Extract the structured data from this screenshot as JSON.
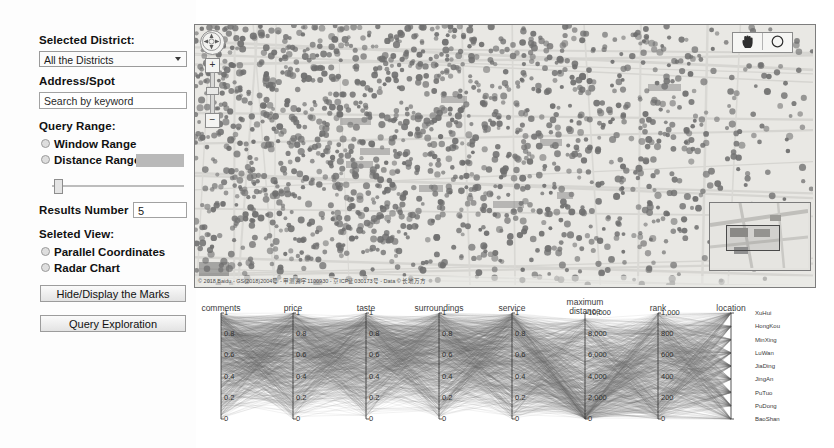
{
  "panel": {
    "district_label": "Selected District:",
    "district_value": "All the Districts",
    "district_options": [
      "All the Districts"
    ],
    "address_label": "Address/Spot",
    "search_placeholder": "Search by keyword",
    "search_value": "Search by keyword",
    "query_range_label": "Query Range:",
    "window_range_label": "Window Range",
    "distance_range_label": "Distance Range",
    "distance_swatch_color": "#b9b9b9",
    "results_number_label": "Results Number",
    "results_number_value": "5",
    "selected_view_label": "Seleted View:",
    "parallel_coordinates_label": "Parallel Coordinates",
    "radar_chart_label": "Radar Chart",
    "hide_display_button": "Hide/Display the Marks",
    "query_exploration_button": "Query Exploration"
  },
  "map": {
    "attribution": "© 2018 Baidu - GS(2018)2004号 - 甲测资字1100930 - 京ICP证030173号 - Data © 长地万方",
    "zoom_in_label": "+",
    "zoom_out_label": "−",
    "tool_pan_name": "hand-tool",
    "tool_circle_name": "circle-select-tool",
    "point_color": "#6f6f6f",
    "background_color": "#e9e8e4"
  },
  "chart_data": {
    "type": "line",
    "subtype": "parallel-coordinates",
    "title": "",
    "axes": [
      {
        "name": "comments",
        "label": "comments",
        "ticks": [
          "1",
          "0.8",
          "0.6",
          "0.4",
          "0.2",
          "0"
        ],
        "range": [
          0,
          1
        ]
      },
      {
        "name": "price",
        "label": "price",
        "ticks": [
          "1",
          "0.8",
          "0.6",
          "0.4",
          "0.2",
          "0"
        ],
        "range": [
          0,
          1
        ]
      },
      {
        "name": "taste",
        "label": "taste",
        "ticks": [
          "1",
          "0.8",
          "0.6",
          "0.4",
          "0.2",
          "0"
        ],
        "range": [
          0,
          1
        ]
      },
      {
        "name": "surroundings",
        "label": "surroundings",
        "ticks": [
          "1",
          "0.8",
          "0.6",
          "0.4",
          "0.2",
          "0"
        ],
        "range": [
          0,
          1
        ]
      },
      {
        "name": "service",
        "label": "service",
        "ticks": [
          "1",
          "0.8",
          "0.6",
          "0.4",
          "0.2",
          "0"
        ],
        "range": [
          0,
          1
        ]
      },
      {
        "name": "maximum_distance",
        "label": "maximum\ndistance",
        "ticks": [
          "10,000",
          "8,000",
          "6,000",
          "4,000",
          "2,000",
          "0"
        ],
        "range": [
          0,
          10000
        ]
      },
      {
        "name": "rank",
        "label": "rank",
        "ticks": [
          "1,000",
          "800",
          "600",
          "400",
          "200",
          "0"
        ],
        "range": [
          0,
          1000
        ]
      },
      {
        "name": "location",
        "label": "location",
        "ticks": [],
        "range": [
          0,
          1
        ]
      }
    ],
    "location_categories": [
      "XuHui",
      "HongKou",
      "MinXing",
      "LuWan",
      "JiaDing",
      "JingAn",
      "PuTuo",
      "PuDong",
      "BaoShan"
    ],
    "line_color": "#6b6b6b",
    "grid": false,
    "legend_position": "right"
  }
}
